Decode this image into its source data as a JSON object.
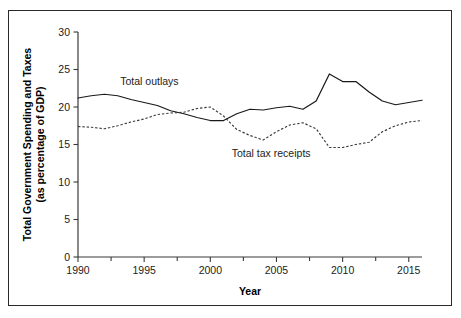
{
  "chart_data": {
    "type": "line",
    "title": "",
    "xlabel": "Year",
    "ylabel": "Total Government Spending and Taxes (as percentage of GDP)",
    "ylabel_line1": "Total Government Spending and Taxes",
    "ylabel_line2": "(as percentage of GDP)",
    "xlim": [
      1990,
      2016
    ],
    "ylim": [
      0,
      30
    ],
    "grid": false,
    "legend_position": "inline-annotations",
    "xticks": [
      1990,
      1995,
      2000,
      2005,
      2010,
      2015
    ],
    "xtick_labels": [
      "1990",
      "1995",
      "2000",
      "2005",
      "2010",
      "2015"
    ],
    "xminor_ticks": [
      1992.5,
      1997.5,
      2002.5,
      2007.5,
      2012.5
    ],
    "yticks": [
      0,
      5,
      10,
      15,
      20,
      25,
      30
    ],
    "ytick_labels": [
      "0",
      "5",
      "10",
      "15",
      "20",
      "25",
      "30"
    ],
    "x": [
      1990,
      1991,
      1992,
      1993,
      1994,
      1995,
      1996,
      1997,
      1998,
      1999,
      2000,
      2001,
      2002,
      2003,
      2004,
      2005,
      2006,
      2007,
      2008,
      2009,
      2010,
      2011,
      2012,
      2013,
      2014,
      2015,
      2016
    ],
    "series": [
      {
        "name": "Total outlays",
        "style": "solid",
        "color": "#1a1a1a",
        "label": "Total outlays",
        "values": [
          21.2,
          21.5,
          21.7,
          21.5,
          21.0,
          20.6,
          20.2,
          19.5,
          19.1,
          18.6,
          18.2,
          18.2,
          19.1,
          19.7,
          19.6,
          19.9,
          20.1,
          19.7,
          20.8,
          24.4,
          23.4,
          23.4,
          22.0,
          20.8,
          20.3,
          20.6,
          20.9
        ]
      },
      {
        "name": "Total tax receipts",
        "style": "dashed",
        "color": "#3a3a3a",
        "label": "Total tax receipts",
        "values": [
          17.4,
          17.3,
          17.1,
          17.5,
          18.0,
          18.4,
          19.0,
          19.2,
          19.3,
          19.8,
          20.0,
          18.8,
          17.0,
          16.2,
          15.6,
          16.7,
          17.6,
          17.9,
          17.1,
          14.6,
          14.6,
          15.0,
          15.3,
          16.7,
          17.5,
          18.0,
          18.2
        ]
      }
    ],
    "annotations": [
      {
        "text": "Total outlays",
        "x": 1995.4,
        "y": 22.9
      },
      {
        "text": "Total tax receipts",
        "x": 2004.6,
        "y": 13.3
      }
    ]
  }
}
